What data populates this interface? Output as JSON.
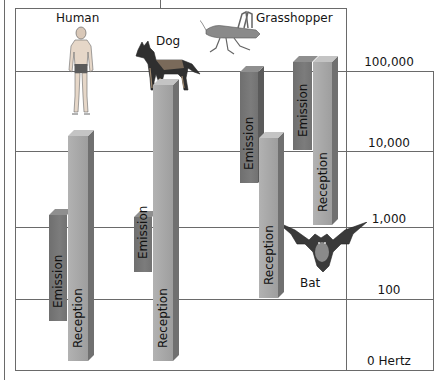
{
  "axis": {
    "unit": "Hertz",
    "ticks": [
      {
        "label": "100,000",
        "value": 100000
      },
      {
        "label": "10,000",
        "value": 10000
      },
      {
        "label": "1,000",
        "value": 1000
      },
      {
        "label": "100",
        "value": 100
      },
      {
        "label": "0 Hertz",
        "value": 0
      }
    ]
  },
  "animals": [
    {
      "name": "Human",
      "icon": "human-icon",
      "emission_label": "Emission",
      "reception_label": "Reception"
    },
    {
      "name": "Dog",
      "icon": "dog-icon",
      "emission_label": "Emission",
      "reception_label": "Reception"
    },
    {
      "name": "Grasshopper",
      "icon": "grasshopper-icon",
      "emission_label": "Emission",
      "reception_label": "Reception"
    },
    {
      "name": "Bat",
      "icon": "bat-icon",
      "emission_label": "Emission",
      "reception_label": "Reception"
    }
  ],
  "colors": {
    "emission": "#767676",
    "reception": "#a8a8a8",
    "grid": "#6a6a6a"
  }
}
